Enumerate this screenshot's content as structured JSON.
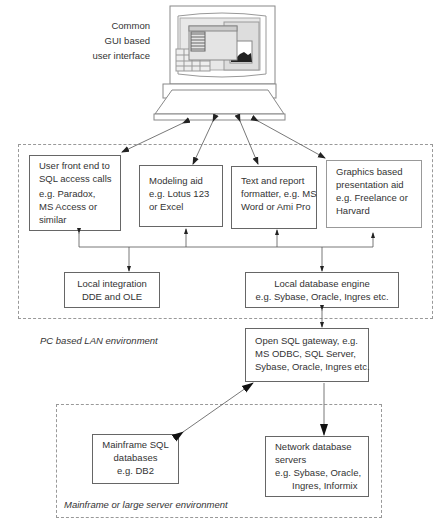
{
  "computer": {
    "caption": [
      "Common",
      "GUI based",
      "user interface"
    ]
  },
  "pc_environment": {
    "label": "PC based LAN environment",
    "tools": [
      {
        "lines": [
          "User front end to",
          "SQL access calls",
          "e.g. Paradox,",
          "MS Access or",
          "similar"
        ]
      },
      {
        "lines": [
          "Modeling aid",
          "e.g. Lotus 123",
          "or Excel"
        ]
      },
      {
        "lines": [
          "Text and report",
          "formatter, e.g. MS",
          "Word or Ami Pro"
        ]
      },
      {
        "lines": [
          "Graphics based",
          "presentation aid",
          "e.g. Freelance or",
          "Harvard"
        ]
      }
    ],
    "local_integration": {
      "lines": [
        "Local integration",
        "DDE and OLE"
      ]
    },
    "local_db_engine": {
      "lines": [
        "Local database engine",
        "e.g. Sybase, Oracle, Ingres etc."
      ]
    },
    "sql_gateway": {
      "lines": [
        "Open SQL gateway, e.g.",
        "MS ODBC, SQL Server,",
        "Sybase, Oracle, Ingres etc."
      ]
    }
  },
  "mainframe_environment": {
    "label": "Mainframe or large server environment",
    "mainframe_sql": {
      "lines": [
        "Mainframe SQL",
        "databases",
        "e.g. DB2"
      ]
    },
    "network_db": {
      "lines": [
        "Network database",
        "servers",
        "e.g. Sybase, Oracle,",
        "Ingres, Informix"
      ]
    }
  }
}
